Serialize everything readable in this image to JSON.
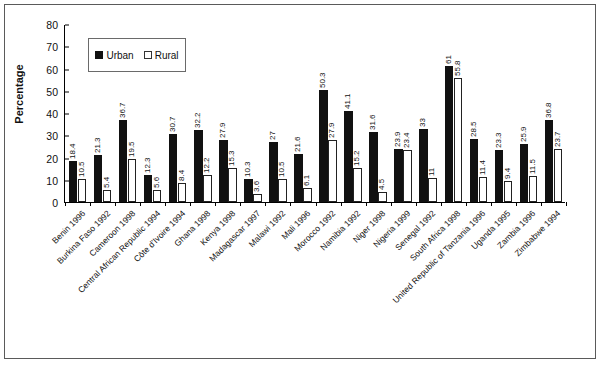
{
  "chart_data": {
    "type": "bar",
    "title": "",
    "xlabel": "",
    "ylabel": "Percentage",
    "ylim": [
      0,
      80
    ],
    "yticks": [
      0,
      10,
      20,
      30,
      40,
      50,
      60,
      70,
      80
    ],
    "grid": false,
    "legend_position": "top-left-inside",
    "legend": [
      "Urban",
      "Rural"
    ],
    "colors": {
      "urban": "#111111",
      "rural": "#ffffff",
      "axis": "#000000",
      "frame": "#5a5a5a"
    },
    "categories": [
      "Benin 1996",
      "Burkina Faso 1992",
      "Cameroon 1998",
      "Central African Republic 1994",
      "Côte d'Ivoire 1994",
      "Ghana 1998",
      "Kenya 1998",
      "Madagascar 1997",
      "Malawi 1992",
      "Mali 1996",
      "Morocco 1992",
      "Namibia 1992",
      "Niger 1998",
      "Nigeria 1999",
      "Senegal 1992",
      "South Africa 1998",
      "United Republic of Tanzania 1996",
      "Uganda 1995",
      "Zambia 1996",
      "Zimbabwe 1994"
    ],
    "series": [
      {
        "name": "Urban",
        "values": [
          18.4,
          21.3,
          36.7,
          12.3,
          30.7,
          32.2,
          27.9,
          10.3,
          27,
          21.6,
          50.3,
          41.1,
          31.6,
          23.9,
          33,
          61,
          28.5,
          23.3,
          25.9,
          36.8
        ]
      },
      {
        "name": "Rural",
        "values": [
          10.5,
          5.4,
          19.5,
          5.6,
          8.4,
          12.2,
          15.3,
          3.6,
          10.5,
          6.1,
          27.9,
          15.2,
          4.5,
          23.4,
          11,
          55.8,
          11.4,
          9.4,
          11.5,
          23.7
        ]
      }
    ]
  }
}
